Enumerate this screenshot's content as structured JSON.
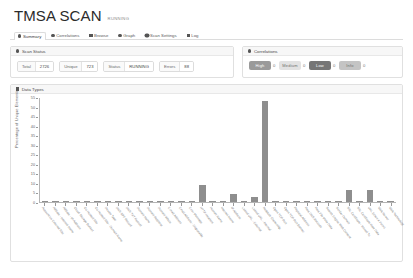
{
  "header": {
    "title": "TMSA SCAN",
    "status_badge": "RUNNING"
  },
  "tabs": [
    {
      "label": "Summary",
      "icon": "dot-icon",
      "active": true
    },
    {
      "label": "Correlations",
      "icon": "dot-icon",
      "active": false
    },
    {
      "label": "Browse",
      "icon": "grid-icon",
      "active": false
    },
    {
      "label": "Graph",
      "icon": "dot-icon",
      "active": false
    },
    {
      "label": "Scan Settings",
      "icon": "gear-icon",
      "active": false
    },
    {
      "label": "Log",
      "icon": "square-icon",
      "active": false
    }
  ],
  "scan_status": {
    "panel_title": "Scan Status",
    "icon": "dot-icon",
    "stats": [
      {
        "key": "Total",
        "value": "2726"
      },
      {
        "key": "Unique",
        "value": "723"
      },
      {
        "key": "Status",
        "value": "RUNNING"
      },
      {
        "key": "Errors",
        "value": "88"
      }
    ]
  },
  "correlations": {
    "panel_title": "Correlations",
    "icon": "dot-icon",
    "items": [
      {
        "label": "High",
        "count": "0",
        "color": "#9a9a9a",
        "text_light": false
      },
      {
        "label": "Medium",
        "count": "0",
        "color": "#e2e2e2",
        "text_light": true
      },
      {
        "label": "Low",
        "count": "0",
        "color": "#767676",
        "text_light": false
      },
      {
        "label": "Info",
        "count": "0",
        "color": "#c4c4c4",
        "text_light": true
      }
    ]
  },
  "data_types": {
    "panel_title": "Data Types",
    "icon": "chart-icon"
  },
  "chart_data": {
    "type": "bar",
    "title": "Data Types",
    "xlabel": "",
    "ylabel": "Percentage of Unique Elements",
    "ylim": [
      0,
      55
    ],
    "yticks": [
      0,
      5,
      10,
      15,
      20,
      25,
      30,
      35,
      40,
      45,
      50,
      55
    ],
    "grid": false,
    "legend": "none",
    "categories": [
      "Account on External Site",
      "Affiliate - Internet Name",
      "Affiliate - IP Address",
      "Cloud Storage Bucket",
      "Co-Hosted Site",
      "Co-Hosted Site - Domain Name",
      "Device Type",
      "DNS SPF Record",
      "DNS TXT Record",
      "Domain Name",
      "Domain Registrar",
      "Domain Whois",
      "E-mail Address",
      "Email Address - Disposable",
      "Error Message",
      "HTTP Headers",
      "Human Name",
      "Internet Name",
      "IP Address",
      "Linked URL - External",
      "Linked URL - Internal",
      "Netblock Ownership",
      "Open TCP Port",
      "Open TCP Port Banner",
      "Physical Address",
      "Raw DNS Records",
      "Raw File Meta Data",
      "Search Engine Web Content",
      "Similar Domain",
      "SSL Certificate - Issued To",
      "SSL Certificate Raw Data",
      "URL (Uses a Form)",
      "Web Server",
      "Web Technology"
    ],
    "values": [
      0.3,
      0.4,
      0.3,
      0.3,
      0.4,
      0.3,
      0.3,
      0.3,
      0.4,
      0.5,
      0.3,
      0.4,
      0.3,
      0.4,
      0.3,
      9.0,
      0.4,
      0.3,
      4.0,
      0.5,
      2.8,
      53.0,
      0.4,
      0.5,
      0.4,
      0.5,
      0.3,
      0.4,
      0.4,
      6.5,
      0.5,
      6.3,
      0.4,
      0.4
    ]
  }
}
